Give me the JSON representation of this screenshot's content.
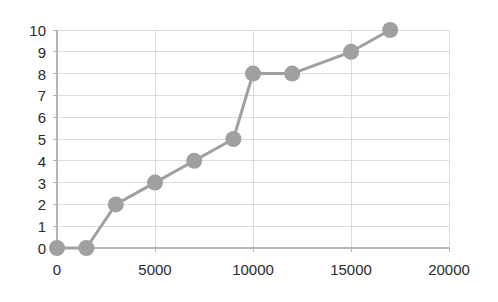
{
  "chart_data": {
    "type": "line",
    "title": "",
    "subtitle": "",
    "xlabel": "",
    "ylabel": "",
    "xlim": [
      0,
      20000
    ],
    "ylim": [
      0,
      10
    ],
    "xticks": [
      0,
      5000,
      10000,
      15000,
      20000
    ],
    "xtick_labels": [
      "0",
      "5000",
      "10000",
      "15000",
      "20000"
    ],
    "yticks": [
      0,
      1,
      2,
      3,
      4,
      5,
      6,
      7,
      8,
      9,
      10
    ],
    "ytick_labels": [
      "0",
      "1",
      "2",
      "3",
      "4",
      "5",
      "6",
      "7",
      "8",
      "9",
      "10"
    ],
    "grid": true,
    "grid_axes": "both",
    "legend": false,
    "legend_position": "none",
    "annotations": [],
    "series": [
      {
        "name": "series-1",
        "marker": "circle",
        "marker_size": 9,
        "line_width": 3,
        "color": "#a0a0a0",
        "x": [
          0,
          1500,
          3000,
          5000,
          7000,
          9000,
          10000,
          12000,
          15000,
          17000
        ],
        "y": [
          0,
          0,
          2,
          3,
          4,
          5,
          8,
          8,
          9,
          10
        ],
        "points": [
          {
            "x": 0,
            "y": 0
          },
          {
            "x": 1500,
            "y": 0
          },
          {
            "x": 3000,
            "y": 2
          },
          {
            "x": 5000,
            "y": 3
          },
          {
            "x": 7000,
            "y": 4
          },
          {
            "x": 9000,
            "y": 5
          },
          {
            "x": 10000,
            "y": 8
          },
          {
            "x": 12000,
            "y": 8
          },
          {
            "x": 15000,
            "y": 9
          },
          {
            "x": 17000,
            "y": 10
          }
        ]
      }
    ]
  },
  "style": {
    "background": "#ffffff",
    "plot_background": "#ffffff",
    "grid_color": "#d9dce3",
    "axis_color": "#b5b5b5",
    "series_color": "#a0a0a0",
    "tick_text_color": "#2b2b2b"
  },
  "plot_geometry": {
    "left": 57,
    "right": 449,
    "top": 30,
    "bottom": 248
  }
}
